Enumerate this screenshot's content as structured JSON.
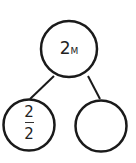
{
  "diagram": {
    "type": "number-bond",
    "whole": {
      "value": "2",
      "unit": "M"
    },
    "parts": [
      {
        "numerator": "2",
        "denominator": "2"
      },
      {
        "value": ""
      }
    ],
    "colors": {
      "stroke": "#1a1a1a",
      "text": "#222222",
      "background": "#ffffff"
    }
  }
}
